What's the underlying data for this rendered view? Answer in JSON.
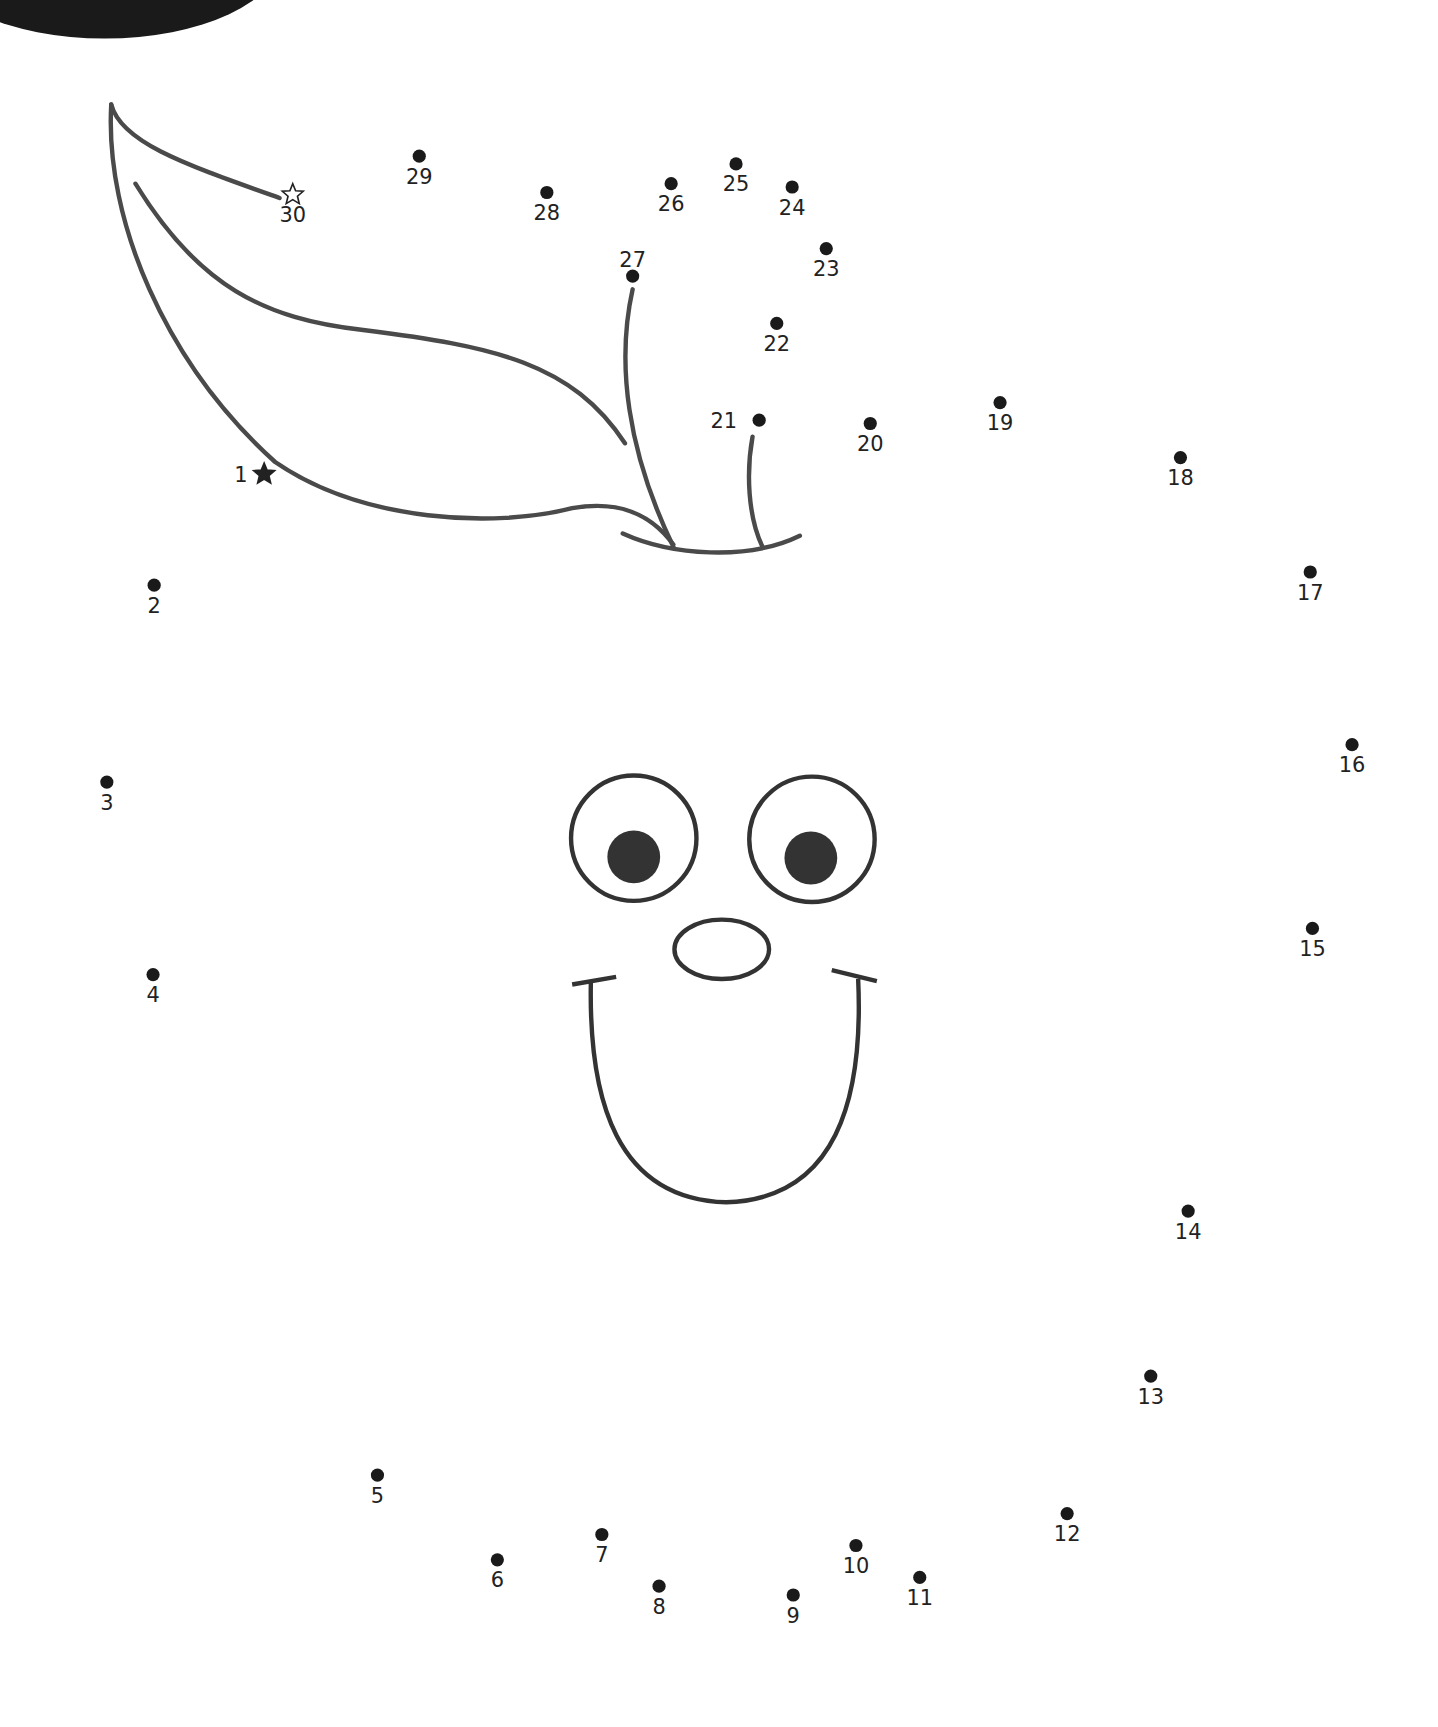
{
  "dots": [
    {
      "n": "1",
      "x": 240,
      "y": 431,
      "shape": "star-filled",
      "lx": -15,
      "ly": 7,
      "anchor": "end"
    },
    {
      "n": "2",
      "x": 140,
      "y": 532
    },
    {
      "n": "3",
      "x": 97,
      "y": 711
    },
    {
      "n": "4",
      "x": 139,
      "y": 886
    },
    {
      "n": "5",
      "x": 343,
      "y": 1341
    },
    {
      "n": "6",
      "x": 452,
      "y": 1418
    },
    {
      "n": "7",
      "x": 547,
      "y": 1395
    },
    {
      "n": "8",
      "x": 599,
      "y": 1442
    },
    {
      "n": "9",
      "x": 721,
      "y": 1450
    },
    {
      "n": "10",
      "x": 778,
      "y": 1405
    },
    {
      "n": "11",
      "x": 836,
      "y": 1434
    },
    {
      "n": "12",
      "x": 970,
      "y": 1376
    },
    {
      "n": "13",
      "x": 1046,
      "y": 1251
    },
    {
      "n": "14",
      "x": 1080,
      "y": 1101
    },
    {
      "n": "15",
      "x": 1193,
      "y": 844
    },
    {
      "n": "16",
      "x": 1229,
      "y": 677
    },
    {
      "n": "17",
      "x": 1191,
      "y": 520
    },
    {
      "n": "18",
      "x": 1073,
      "y": 416
    },
    {
      "n": "19",
      "x": 909,
      "y": 366
    },
    {
      "n": "20",
      "x": 791,
      "y": 385
    },
    {
      "n": "21",
      "x": 690,
      "y": 382,
      "lx": -20,
      "ly": 7,
      "anchor": "end"
    },
    {
      "n": "22",
      "x": 706,
      "y": 294
    },
    {
      "n": "23",
      "x": 751,
      "y": 226
    },
    {
      "n": "24",
      "x": 720,
      "y": 170
    },
    {
      "n": "25",
      "x": 669,
      "y": 149
    },
    {
      "n": "26",
      "x": 610,
      "y": 167
    },
    {
      "n": "27",
      "x": 575,
      "y": 251,
      "lx": 0,
      "ly": -8
    },
    {
      "n": "28",
      "x": 497,
      "y": 175
    },
    {
      "n": "29",
      "x": 381,
      "y": 142
    },
    {
      "n": "30",
      "x": 266,
      "y": 177,
      "shape": "star-outline"
    }
  ]
}
